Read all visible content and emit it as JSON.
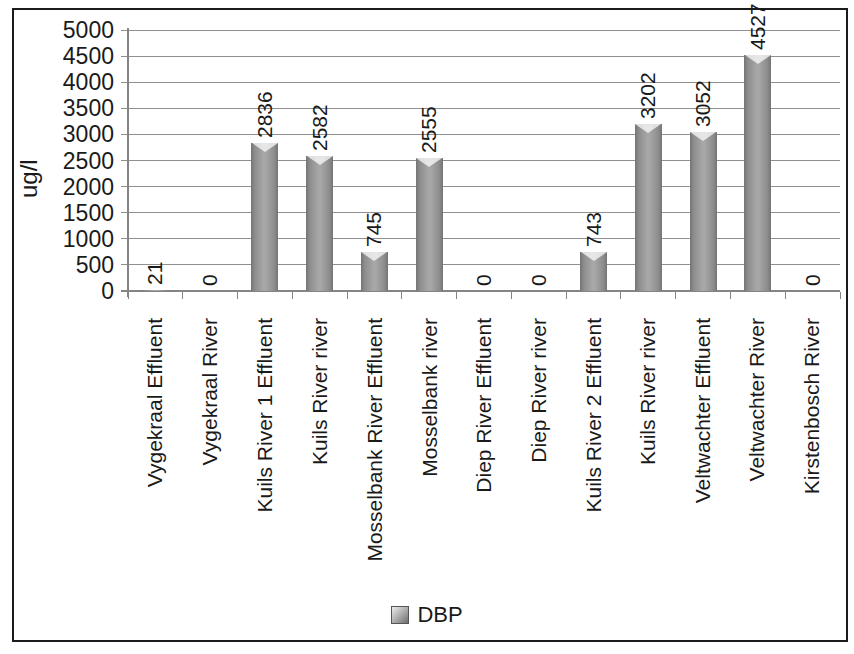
{
  "chart_data": {
    "type": "bar",
    "title": "",
    "ylabel": "ug/l",
    "xlabel": "",
    "ylim": [
      0,
      5000
    ],
    "yticks": [
      0,
      500,
      1000,
      1500,
      2000,
      2500,
      3000,
      3500,
      4000,
      4500,
      5000
    ],
    "grid": true,
    "legend": {
      "position": "bottom",
      "entries": [
        "DBP"
      ]
    },
    "categories": [
      "Vygekraal Effluent",
      "Vygekraal River",
      "Kuils River 1 Effluent",
      "Kuils River river",
      "Mosselbank River Effluent",
      "Mosselbank river",
      "Diep River Effluent",
      "Diep River river",
      "Kuils River 2 Effluent",
      "Kuils River river",
      "Veltwachter Effluent",
      "Veltwachter River",
      "Kirstenbosch River"
    ],
    "series": [
      {
        "name": "DBP",
        "values": [
          21,
          0,
          2836,
          2582,
          745,
          2555,
          0,
          0,
          743,
          3202,
          3052,
          4527,
          0
        ]
      }
    ],
    "bar_labels": [
      "21",
      "0",
      "2836",
      "2582",
      "745",
      "2555",
      "0",
      "0",
      "743",
      "3202",
      "3052",
      "4527",
      "0"
    ],
    "colors": {
      "bar": "#9c9c9c",
      "bar_edge": "#747474",
      "gridline": "#909090",
      "axis": "#848484",
      "text": "#1a1a1a",
      "frame": "#1b1b1b",
      "background": "#ffffff"
    }
  }
}
